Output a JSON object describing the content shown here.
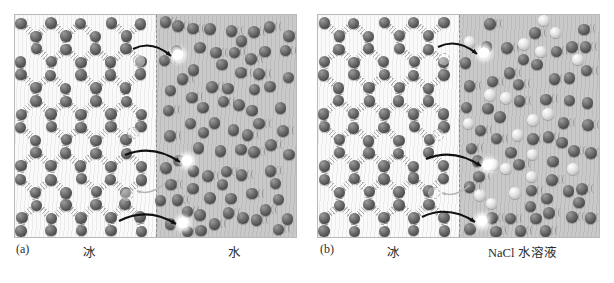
{
  "figure": {
    "type": "two-panel molecular schematic",
    "panels": [
      {
        "index_label": "(a)",
        "left_region_label": "冰",
        "right_region_label": "水",
        "left_phase": "ice",
        "right_phase": "water",
        "interface_style": "vertical dashed line",
        "escaping_molecule_count": 3,
        "returning_molecule_count": 1,
        "net_direction": "melting: molecules leave the ice lattice into liquid water",
        "species": [
          {
            "name": "water-molecule",
            "color": "#5a5a5a",
            "role": "H2O sphere"
          },
          {
            "name": "escaping-molecule",
            "color": "#ffffff",
            "role": "highlighted detaching H2O"
          },
          {
            "name": "vacancy-ghost",
            "color": "#b0b0b0",
            "role": "dashed outline of vacated site"
          }
        ]
      },
      {
        "index_label": "(b)",
        "left_region_label": "冰",
        "right_region_label": "NaCl 水溶液",
        "left_phase": "ice",
        "right_phase": "aqueous NaCl solution",
        "interface_style": "vertical dashed line",
        "escaping_molecule_count": 3,
        "returning_molecule_count": 1,
        "net_direction": "melting enhanced: solute ions reduce return of water molecules to the lattice",
        "species": [
          {
            "name": "water-molecule",
            "color": "#5a5a5a",
            "role": "H2O sphere"
          },
          {
            "name": "ion",
            "color": "#dcdcdc",
            "role": "Na+ / Cl- solute sphere"
          },
          {
            "name": "escaping-molecule",
            "color": "#ffffff",
            "role": "highlighted detaching H2O"
          },
          {
            "name": "vacancy-ghost",
            "color": "#b0b0b0",
            "role": "dashed outline of vacated site"
          }
        ]
      }
    ],
    "legend_notes": {
      "hydrogen_bond": "short parallel ladder ticks between lattice spheres",
      "thermal_motion": "small double-arc wiggle marks beside liquid molecules",
      "arrow": "curved black arrow crossing the interface"
    }
  },
  "captions": {
    "a_index": "(a)",
    "a_left": "冰",
    "a_right": "水",
    "b_index": "(b)",
    "b_left": "冰",
    "b_right": "NaCl 水溶液"
  }
}
